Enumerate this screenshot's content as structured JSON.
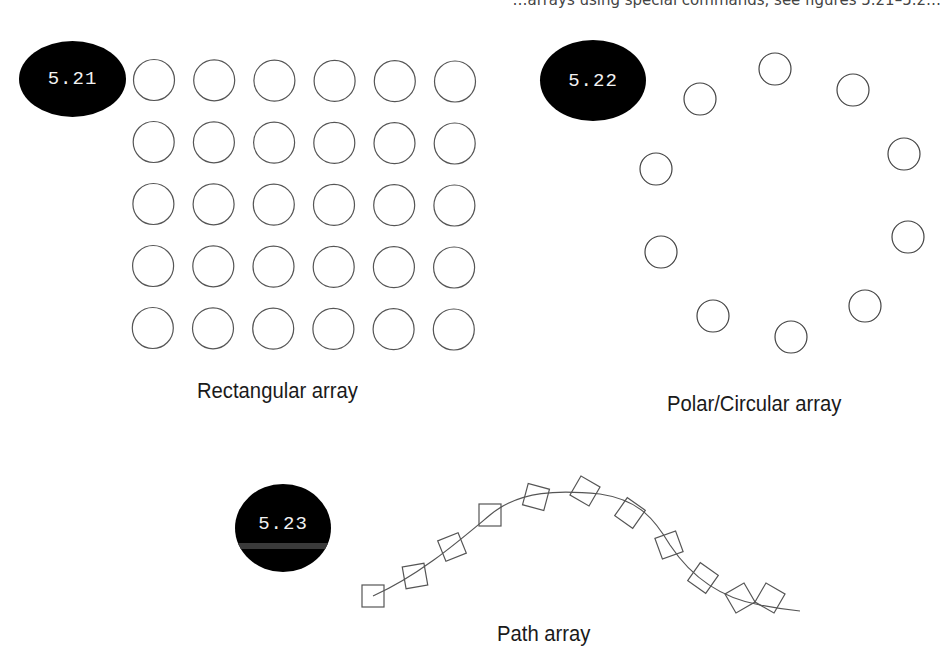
{
  "header": {
    "clipped_text": "…arrays using special commands, see figures 5.21–5.2…"
  },
  "figures": [
    {
      "id": "5.21",
      "badge_label": "5.21",
      "caption": "Rectangular array",
      "type": "rectangular",
      "rows": 5,
      "columns": 6,
      "element": "circle"
    },
    {
      "id": "5.22",
      "badge_label": "5.22",
      "caption": "Polar/Circular array",
      "type": "polar",
      "count": 10,
      "element": "circle"
    },
    {
      "id": "5.23",
      "badge_label": "5.23",
      "caption": "Path array",
      "type": "path",
      "count": 11,
      "element": "square"
    }
  ],
  "colors": {
    "badge_fill": "#000000",
    "badge_text": "#f2f2f2",
    "stroke": "#555555",
    "caption": "#1a1a1a",
    "background": "#ffffff"
  }
}
